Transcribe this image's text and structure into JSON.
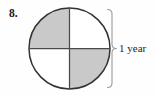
{
  "figure": {
    "problem_number": "8.",
    "type": "fraction-circle-diagram",
    "bracket_label": "1 year",
    "colors": {
      "shaded": "#c9c9c9",
      "unshaded": "#ffffff",
      "outline": "#333333",
      "divider": "#4a4a4a",
      "bracket": "#9a9a9a",
      "text": "#1a1a1a",
      "background": "#fefefe"
    },
    "circle": {
      "center_x": 69.5,
      "center_y": 48.5,
      "radius": 40.5,
      "divisions": 4,
      "shaded_count": 2,
      "fraction": "2/4",
      "quadrants": [
        {
          "name": "top-left",
          "shaded": true
        },
        {
          "name": "top-right",
          "shaded": false
        },
        {
          "name": "bottom-right",
          "shaded": true
        },
        {
          "name": "bottom-left",
          "shaded": false
        }
      ]
    },
    "bracket": {
      "x": 112,
      "top_y": 9,
      "bottom_y": 88,
      "orientation": "right"
    }
  }
}
